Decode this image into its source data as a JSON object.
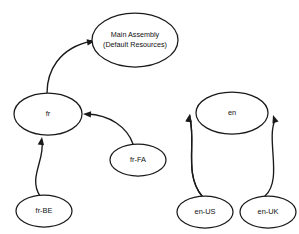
{
  "diagram": {
    "background_color": "#ffffff",
    "stroke_color": "#1a1a1a",
    "text_color": "#111111",
    "nodes": [
      {
        "id": "main",
        "shape": "ellipse",
        "label_line1": "Main Assembly",
        "label_line2": "(Default Resources)",
        "cx": 135,
        "cy": 40,
        "rx": 43,
        "ry": 27
      },
      {
        "id": "fr",
        "shape": "ellipse",
        "label_line1": "fr",
        "label_line2": "",
        "cx": 48,
        "cy": 114,
        "rx": 34,
        "ry": 21
      },
      {
        "id": "en",
        "shape": "ellipse",
        "label_line1": "en",
        "label_line2": "",
        "cx": 232,
        "cy": 113,
        "rx": 36,
        "ry": 21
      },
      {
        "id": "fr-fa",
        "shape": "ellipse",
        "label_line1": "fr-FA",
        "label_line2": "",
        "cx": 138,
        "cy": 160,
        "rx": 28,
        "ry": 16
      },
      {
        "id": "fr-be",
        "shape": "ellipse",
        "label_line1": "fr-BE",
        "label_line2": "",
        "cx": 44,
        "cy": 211,
        "rx": 28,
        "ry": 16
      },
      {
        "id": "en-us",
        "shape": "ellipse",
        "label_line1": "en-US",
        "label_line2": "",
        "cx": 205,
        "cy": 212,
        "rx": 28,
        "ry": 16
      },
      {
        "id": "en-uk",
        "shape": "ellipse",
        "label_line1": "en-UK",
        "label_line2": "",
        "cx": 268,
        "cy": 212,
        "rx": 28,
        "ry": 16
      }
    ],
    "edges": [
      {
        "id": "fr-to-main",
        "from": "fr",
        "to": "main",
        "arrow": "to",
        "path": "M 47 93 C 47 72 58 48 92 41",
        "arrow_tip_x": 95,
        "arrow_tip_y": 41,
        "arrow_angle": -10
      },
      {
        "id": "en-to-main",
        "from": "en",
        "to": "main",
        "arrow": "to",
        "path": "M 233 92 C 233 70 218 48 181 41",
        "arrow_tip_x": 178,
        "arrow_tip_y": 41,
        "arrow_angle": 190
      },
      {
        "id": "frfa-to-fr",
        "from": "fr-fa",
        "to": "fr",
        "arrow": "to",
        "path": "M 133 144 C 127 127 110 115 87 114",
        "arrow_tip_x": 83,
        "arrow_tip_y": 114,
        "arrow_angle": 183
      },
      {
        "id": "frbe-to-fr",
        "from": "fr-be",
        "to": "fr",
        "arrow": "to",
        "path": "M 40 196 C 28 178 45 160 42 141",
        "arrow_tip_x": 42,
        "arrow_tip_y": 137,
        "arrow_angle": -82
      },
      {
        "id": "enus-to-en",
        "from": "en-us",
        "to": "en",
        "arrow": "to",
        "path": "M 202 196 C 184 175 196 142 190 119",
        "arrow_tip_x": 190,
        "arrow_tip_y": 114,
        "arrow_angle": -80
      },
      {
        "id": "enuk-to-en",
        "from": "en-uk",
        "to": "en",
        "arrow": "to",
        "path": "M 265 196 C 283 180 266 140 275 120",
        "arrow_tip_x": 273,
        "arrow_tip_y": 115,
        "arrow_angle": -108
      }
    ]
  }
}
